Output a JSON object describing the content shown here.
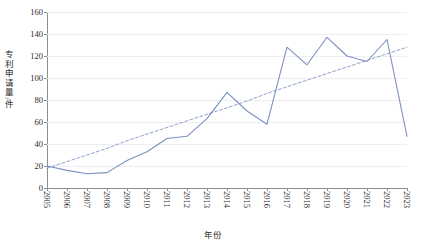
{
  "chart_data": {
    "type": "line",
    "title": "",
    "xlabel": "年份",
    "ylabel": "专利申请量/件",
    "categories": [
      "2005",
      "2006",
      "2007",
      "2008",
      "2009",
      "2010",
      "2011",
      "2012",
      "2013",
      "2014",
      "2015",
      "2016",
      "2017",
      "2018",
      "2019",
      "2020",
      "2021",
      "2022",
      "2023"
    ],
    "x": [
      2005,
      2006,
      2007,
      2008,
      2009,
      2010,
      2011,
      2012,
      2013,
      2014,
      2015,
      2016,
      2017,
      2018,
      2019,
      2020,
      2021,
      2022,
      2023
    ],
    "series": [
      {
        "name": "专利申请量",
        "style": "solid",
        "color": "#7b8fc0",
        "values": [
          20,
          16,
          13,
          14,
          25,
          33,
          45,
          47,
          63,
          87,
          70,
          58,
          128,
          112,
          137,
          120,
          115,
          135,
          47
        ]
      },
      {
        "name": "趋势线",
        "style": "dashed",
        "color": "#8fa0cf",
        "values": [
          18,
          24,
          30,
          36,
          43,
          49,
          55,
          61,
          67,
          73,
          79,
          86,
          92,
          98,
          104,
          110,
          116,
          122,
          128
        ]
      }
    ],
    "ylim": [
      0,
      160
    ],
    "yticks": [
      0,
      20,
      40,
      60,
      80,
      100,
      120,
      140,
      160
    ],
    "xlim": [
      2005,
      2023
    ],
    "grid": true,
    "grid_axis": "y",
    "legend": "none"
  },
  "colors": {
    "series_line": "#7b8fc0",
    "trendline": "#8fa0cf",
    "axis": "#8c8c8c",
    "gridline": "#ededf2",
    "text": "#2b2b2b",
    "background": "#ffffff"
  }
}
